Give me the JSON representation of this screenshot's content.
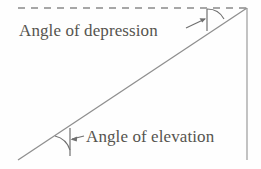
{
  "figure": {
    "background_color": "#fefefe",
    "line_color": "#8a8a8a",
    "text_color": "#56544f",
    "labels": {
      "depression": "Angle of depression",
      "elevation": "Angle of elevation"
    },
    "elements": {
      "horizontal_dashed_line": "dashed-horizontal-reference-line",
      "sight_line": "diagonal-line-of-sight",
      "vertical_line": "vertical-height-line",
      "depression_angle_marker": "depression-angle-arc",
      "elevation_angle_marker": "elevation-angle-arc",
      "depression_pointer": "depression-leader-arrow",
      "elevation_pointer": "elevation-leader-arrow"
    },
    "geometry": {
      "dashed_line": {
        "x1": 18,
        "y1": 8,
        "x2": 247,
        "y2": 8
      },
      "sight_line": {
        "x1": 18,
        "y1": 160,
        "x2": 247,
        "y2": 8
      },
      "vertical_line": {
        "x1": 247,
        "y1": 8,
        "x2": 247,
        "y2": 160
      },
      "depression_tick": {
        "x1": 207,
        "y1": 9,
        "x2": 207,
        "y2": 31
      },
      "elevation_tick": {
        "x1": 70,
        "y1": 128,
        "x2": 70,
        "y2": 156
      }
    }
  }
}
